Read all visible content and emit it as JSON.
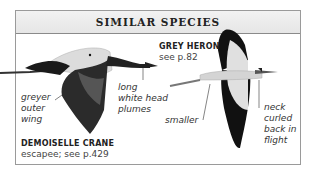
{
  "panel": {
    "title": "SIMILAR SPECIES",
    "border_color": "#9a9a9a",
    "header_bg": "#ececec"
  },
  "species": [
    {
      "name": "DEMOISELLE CRANE",
      "reference": "escapee; see p.429",
      "annotations": [
        {
          "text_lines": [
            "greyer",
            "outer",
            "wing"
          ]
        },
        {
          "text_lines": [
            "long",
            "white head",
            "plumes"
          ]
        }
      ]
    },
    {
      "name": "GREY HERON",
      "reference": "see p.82",
      "annotations": [
        {
          "text_lines": [
            "smaller"
          ]
        },
        {
          "text_lines": [
            "neck",
            "curled",
            "back in",
            "flight"
          ]
        }
      ]
    }
  ],
  "icons": {
    "crane_illustration": "crane-in-flight",
    "heron_illustration": "heron-in-flight"
  }
}
